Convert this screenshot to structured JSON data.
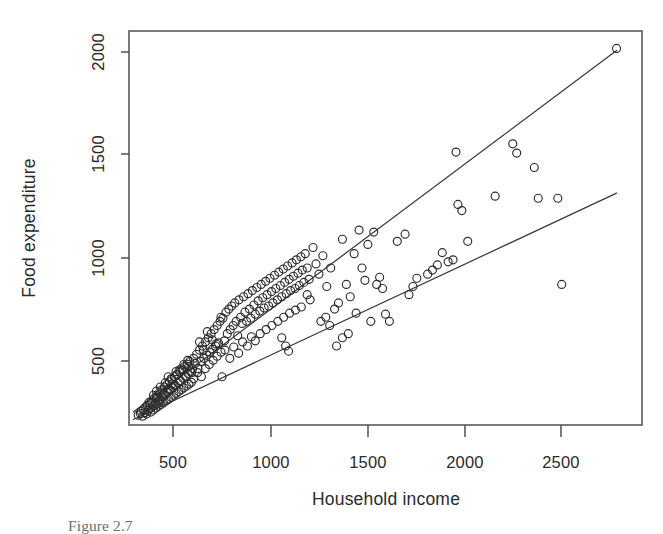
{
  "figure": {
    "caption_partial": "Figure 2.7"
  },
  "chart_data": {
    "type": "scatter",
    "title": "",
    "xlabel": "Household income",
    "ylabel": "Food expenditure",
    "xlim": [
      330,
      2950
    ],
    "ylim": [
      195,
      2115
    ],
    "xticks": [
      500,
      1000,
      1500,
      2000,
      2500
    ],
    "yticks": [
      500,
      1000,
      1500,
      2000
    ],
    "xtick_labels": [
      "500",
      "1000",
      "1500",
      "2000",
      "2500"
    ],
    "ytick_labels": [
      "500",
      "1000",
      "1500",
      "2000"
    ],
    "grid": false,
    "legend": "none",
    "marker": "open-circle",
    "marker_size": 4.0,
    "point_color": "#2d2d2d",
    "line_color": "#3a3a3a",
    "frame_color": "#4a4a4a",
    "background": "#ffffff",
    "series": [
      {
        "name": "households",
        "type": "scatter",
        "points": [
          [
            377,
            243
          ],
          [
            388,
            251
          ],
          [
            392,
            262
          ],
          [
            399,
            238
          ],
          [
            404,
            270
          ],
          [
            410,
            255
          ],
          [
            415,
            283
          ],
          [
            419,
            248
          ],
          [
            424,
            292
          ],
          [
            428,
            266
          ],
          [
            432,
            305
          ],
          [
            437,
            276
          ],
          [
            441,
            258
          ],
          [
            446,
            312
          ],
          [
            450,
            287
          ],
          [
            454,
            268
          ],
          [
            459,
            325
          ],
          [
            463,
            299
          ],
          [
            467,
            278
          ],
          [
            472,
            338
          ],
          [
            476,
            310
          ],
          [
            480,
            286
          ],
          [
            485,
            352
          ],
          [
            489,
            320
          ],
          [
            493,
            295
          ],
          [
            498,
            366
          ],
          [
            502,
            331
          ],
          [
            506,
            303
          ],
          [
            511,
            380
          ],
          [
            515,
            342
          ],
          [
            519,
            312
          ],
          [
            524,
            393
          ],
          [
            528,
            354
          ],
          [
            532,
            321
          ],
          [
            536,
            406
          ],
          [
            541,
            365
          ],
          [
            545,
            330
          ],
          [
            549,
            418
          ],
          [
            554,
            377
          ],
          [
            558,
            340
          ],
          [
            562,
            430
          ],
          [
            567,
            388
          ],
          [
            571,
            349
          ],
          [
            575,
            442
          ],
          [
            580,
            400
          ],
          [
            584,
            358
          ],
          [
            588,
            455
          ],
          [
            593,
            411
          ],
          [
            597,
            367
          ],
          [
            601,
            468
          ],
          [
            606,
            423
          ],
          [
            610,
            376
          ],
          [
            614,
            480
          ],
          [
            619,
            434
          ],
          [
            623,
            385
          ],
          [
            627,
            492
          ],
          [
            632,
            446
          ],
          [
            636,
            394
          ],
          [
            640,
            505
          ],
          [
            645,
            457
          ],
          [
            649,
            403
          ],
          [
            440,
            300
          ],
          [
            455,
            340
          ],
          [
            470,
            360
          ],
          [
            485,
            310
          ],
          [
            500,
            355
          ],
          [
            515,
            400
          ],
          [
            530,
            370
          ],
          [
            545,
            420
          ],
          [
            560,
            390
          ],
          [
            575,
            440
          ],
          [
            590,
            410
          ],
          [
            605,
            460
          ],
          [
            620,
            430
          ],
          [
            635,
            480
          ],
          [
            650,
            450
          ],
          [
            470,
            330
          ],
          [
            490,
            380
          ],
          [
            510,
            345
          ],
          [
            530,
            430
          ],
          [
            550,
            395
          ],
          [
            570,
            455
          ],
          [
            590,
            465
          ],
          [
            610,
            490
          ],
          [
            630,
            510
          ],
          [
            655,
            470
          ],
          [
            660,
            520
          ],
          [
            668,
            495
          ],
          [
            675,
            540
          ],
          [
            682,
            470
          ],
          [
            690,
            560
          ],
          [
            697,
            505
          ],
          [
            705,
            580
          ],
          [
            712,
            520
          ],
          [
            720,
            600
          ],
          [
            727,
            535
          ],
          [
            735,
            620
          ],
          [
            742,
            550
          ],
          [
            750,
            640
          ],
          [
            757,
            565
          ],
          [
            765,
            660
          ],
          [
            772,
            580
          ],
          [
            780,
            680
          ],
          [
            787,
            595
          ],
          [
            795,
            700
          ],
          [
            660,
            420
          ],
          [
            680,
            450
          ],
          [
            700,
            430
          ],
          [
            720,
            470
          ],
          [
            740,
            490
          ],
          [
            760,
            510
          ],
          [
            780,
            530
          ],
          [
            800,
            550
          ],
          [
            690,
            600
          ],
          [
            710,
            560
          ],
          [
            730,
            650
          ],
          [
            755,
            610
          ],
          [
            775,
            590
          ],
          [
            800,
            720
          ],
          [
            805,
            430
          ],
          [
            810,
            715
          ],
          [
            818,
            605
          ],
          [
            825,
            745
          ],
          [
            832,
            640
          ],
          [
            840,
            760
          ],
          [
            847,
            660
          ],
          [
            855,
            775
          ],
          [
            862,
            680
          ],
          [
            870,
            790
          ],
          [
            877,
            700
          ],
          [
            885,
            630
          ],
          [
            892,
            805
          ],
          [
            900,
            720
          ],
          [
            908,
            690
          ],
          [
            915,
            820
          ],
          [
            922,
            745
          ],
          [
            930,
            700
          ],
          [
            938,
            835
          ],
          [
            945,
            760
          ],
          [
            952,
            715
          ],
          [
            820,
            560
          ],
          [
            845,
            520
          ],
          [
            865,
            575
          ],
          [
            890,
            545
          ],
          [
            910,
            600
          ],
          [
            935,
            580
          ],
          [
            955,
            625
          ],
          [
            975,
            605
          ],
          [
            960,
            850
          ],
          [
            968,
            780
          ],
          [
            975,
            735
          ],
          [
            983,
            865
          ],
          [
            990,
            800
          ],
          [
            998,
            750
          ],
          [
            1005,
            880
          ],
          [
            1013,
            815
          ],
          [
            1020,
            765
          ],
          [
            1028,
            895
          ],
          [
            1035,
            830
          ],
          [
            1043,
            775
          ],
          [
            1050,
            910
          ],
          [
            1058,
            845
          ],
          [
            1065,
            790
          ],
          [
            1073,
            925
          ],
          [
            1080,
            860
          ],
          [
            1000,
            640
          ],
          [
            1030,
            660
          ],
          [
            1060,
            680
          ],
          [
            1090,
            700
          ],
          [
            1088,
            805
          ],
          [
            1095,
            940
          ],
          [
            1103,
            875
          ],
          [
            1110,
            820
          ],
          [
            1118,
            955
          ],
          [
            1125,
            890
          ],
          [
            1133,
            835
          ],
          [
            1140,
            970
          ],
          [
            1148,
            905
          ],
          [
            1155,
            850
          ],
          [
            1163,
            985
          ],
          [
            1170,
            920
          ],
          [
            1178,
            860
          ],
          [
            1185,
            1000
          ],
          [
            1193,
            935
          ],
          [
            1200,
            875
          ],
          [
            1120,
            720
          ],
          [
            1150,
            740
          ],
          [
            1180,
            755
          ],
          [
            1210,
            770
          ],
          [
            1208,
            1015
          ],
          [
            1215,
            950
          ],
          [
            1223,
            890
          ],
          [
            1230,
            1030
          ],
          [
            1240,
            960
          ],
          [
            1250,
            905
          ],
          [
            1145,
            555
          ],
          [
            1130,
            580
          ],
          [
            1110,
            620
          ],
          [
            1240,
            830
          ],
          [
            1255,
            805
          ],
          [
            1270,
            1060
          ],
          [
            1285,
            980
          ],
          [
            1300,
            930
          ],
          [
            1320,
            1020
          ],
          [
            1340,
            870
          ],
          [
            1360,
            960
          ],
          [
            1310,
            700
          ],
          [
            1335,
            720
          ],
          [
            1355,
            680
          ],
          [
            1380,
            760
          ],
          [
            1400,
            790
          ],
          [
            1420,
            1100
          ],
          [
            1440,
            880
          ],
          [
            1460,
            820
          ],
          [
            1480,
            1030
          ],
          [
            1490,
            740
          ],
          [
            1505,
            1145
          ],
          [
            1520,
            960
          ],
          [
            1535,
            900
          ],
          [
            1550,
            1075
          ],
          [
            1565,
            700
          ],
          [
            1580,
            1135
          ],
          [
            1595,
            880
          ],
          [
            1610,
            915
          ],
          [
            1625,
            860
          ],
          [
            1420,
            620
          ],
          [
            1450,
            640
          ],
          [
            1390,
            580
          ],
          [
            1640,
            735
          ],
          [
            1660,
            700
          ],
          [
            1700,
            1090
          ],
          [
            1740,
            1125
          ],
          [
            1760,
            830
          ],
          [
            1780,
            870
          ],
          [
            1800,
            910
          ],
          [
            1855,
            930
          ],
          [
            1880,
            950
          ],
          [
            1905,
            975
          ],
          [
            1930,
            1035
          ],
          [
            1960,
            990
          ],
          [
            1985,
            1000
          ],
          [
            2000,
            1525
          ],
          [
            2010,
            1270
          ],
          [
            2030,
            1240
          ],
          [
            2060,
            1090
          ],
          [
            2200,
            1310
          ],
          [
            2290,
            1565
          ],
          [
            2310,
            1520
          ],
          [
            2400,
            1450
          ],
          [
            2420,
            1300
          ],
          [
            2520,
            1300
          ],
          [
            2540,
            880
          ],
          [
            2820,
            2030
          ]
        ]
      },
      {
        "name": "upper-quantile-fit",
        "type": "line",
        "points": [
          [
            352,
            258
          ],
          [
            2820,
            2020
          ]
        ],
        "description": "upper quantile regression line"
      },
      {
        "name": "lower-quantile-fit",
        "type": "line",
        "points": [
          [
            352,
            222
          ],
          [
            2820,
            1325
          ]
        ],
        "description": "lower quantile regression line"
      }
    ]
  }
}
